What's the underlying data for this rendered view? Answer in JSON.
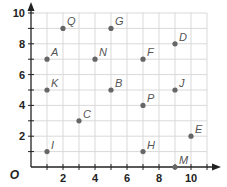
{
  "chart_data": {
    "type": "scatter",
    "title": "",
    "xlabel": "",
    "ylabel": "",
    "origin_label": "O",
    "xlim": [
      0,
      11
    ],
    "ylim": [
      0,
      10
    ],
    "grid": true,
    "x_ticks": [
      2,
      4,
      6,
      8,
      10
    ],
    "y_ticks": [
      2,
      4,
      6,
      8,
      10
    ],
    "points": [
      {
        "label": "Q",
        "x": 2,
        "y": 9
      },
      {
        "label": "G",
        "x": 5,
        "y": 9
      },
      {
        "label": "D",
        "x": 9,
        "y": 8
      },
      {
        "label": "A",
        "x": 1,
        "y": 7
      },
      {
        "label": "N",
        "x": 4,
        "y": 7
      },
      {
        "label": "F",
        "x": 7,
        "y": 7
      },
      {
        "label": "K",
        "x": 1,
        "y": 5
      },
      {
        "label": "B",
        "x": 5,
        "y": 5
      },
      {
        "label": "J",
        "x": 9,
        "y": 5
      },
      {
        "label": "P",
        "x": 7,
        "y": 4
      },
      {
        "label": "C",
        "x": 3,
        "y": 3
      },
      {
        "label": "E",
        "x": 10,
        "y": 2
      },
      {
        "label": "I",
        "x": 1,
        "y": 1
      },
      {
        "label": "H",
        "x": 7,
        "y": 1
      },
      {
        "label": "M",
        "x": 9,
        "y": 0
      }
    ],
    "colors": {
      "grid": "#d9d9d9",
      "axis": "#222222",
      "point": "#666666",
      "label": "#555555"
    }
  }
}
